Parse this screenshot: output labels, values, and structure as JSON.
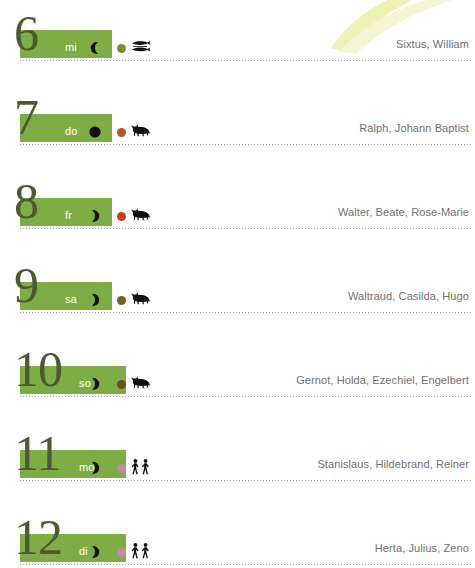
{
  "theme": {
    "bar_color": "#7fad45",
    "number_color": "#4c5a33",
    "abbr_color": "#ffffff",
    "names_color": "#6f6f6f",
    "divider_color": "#9aa0a6",
    "swoosh_color": "#eef0b4"
  },
  "decoration": {
    "swoosh_name": "leaf-swoosh-ornament"
  },
  "days": [
    {
      "number": "6",
      "weekday_abbr": "mi",
      "moon": {
        "icon": "moon-waning-crescent-icon",
        "phase": "waning-crescent"
      },
      "element_dot": {
        "icon": "element-dot-icon",
        "color": "#6f9233"
      },
      "zodiac": {
        "icon": "zodiac-pisces-fish-icon",
        "sign": "pisces"
      },
      "names": "Sixtus, William"
    },
    {
      "number": "7",
      "weekday_abbr": "do",
      "moon": {
        "icon": "moon-new-icon",
        "phase": "new-moon"
      },
      "element_dot": {
        "icon": "element-dot-icon",
        "color": "#b4582c"
      },
      "zodiac": {
        "icon": "zodiac-taurus-bull-icon",
        "sign": "taurus"
      },
      "names": "Ralph, Johann Baptist"
    },
    {
      "number": "8",
      "weekday_abbr": "fr",
      "moon": {
        "icon": "moon-waxing-crescent-icon",
        "phase": "waxing-crescent"
      },
      "element_dot": {
        "icon": "element-dot-icon",
        "color": "#c0402a"
      },
      "zodiac": {
        "icon": "zodiac-taurus-bull-icon",
        "sign": "taurus"
      },
      "names": "Walter, Beate, Rose-Marie"
    },
    {
      "number": "9",
      "weekday_abbr": "sa",
      "moon": {
        "icon": "moon-waxing-crescent-icon",
        "phase": "waxing-crescent"
      },
      "element_dot": {
        "icon": "element-dot-icon",
        "color": "#7a5e28"
      },
      "zodiac": {
        "icon": "zodiac-taurus-bull-icon",
        "sign": "taurus"
      },
      "names": "Waltraud, Casilda, Hugo"
    },
    {
      "number": "10",
      "weekday_abbr": "so",
      "moon": {
        "icon": "moon-waxing-crescent-icon",
        "phase": "waxing-crescent"
      },
      "element_dot": {
        "icon": "element-dot-icon",
        "color": "#6b4f22"
      },
      "zodiac": {
        "icon": "zodiac-taurus-bull-icon",
        "sign": "taurus"
      },
      "names": "Gernot, Holda, Ezechiel, Engelbert"
    },
    {
      "number": "11",
      "weekday_abbr": "mo",
      "moon": {
        "icon": "moon-waxing-crescent-icon",
        "phase": "waxing-crescent"
      },
      "element_dot": {
        "icon": "element-dot-icon",
        "color": "#c489a8"
      },
      "zodiac": {
        "icon": "zodiac-gemini-twins-icon",
        "sign": "gemini"
      },
      "names": "Stanislaus, Hildebrand, Reiner"
    },
    {
      "number": "12",
      "weekday_abbr": "di",
      "moon": {
        "icon": "moon-waxing-crescent-icon",
        "phase": "waxing-crescent"
      },
      "element_dot": {
        "icon": "element-dot-icon",
        "color": "#c489a8"
      },
      "zodiac": {
        "icon": "zodiac-gemini-twins-icon",
        "sign": "gemini"
      },
      "names": "Herta, Julius, Zeno"
    }
  ]
}
